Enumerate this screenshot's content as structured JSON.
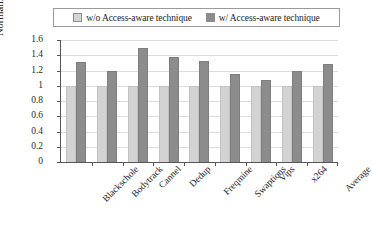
{
  "chart_data": {
    "type": "bar",
    "title": "",
    "xlabel": "",
    "ylabel": "Normalized lifetime",
    "ylim": [
      0,
      1.6
    ],
    "ytick_values": [
      0,
      0.2,
      0.4,
      0.6,
      0.8,
      1,
      1.2,
      1.4,
      1.6
    ],
    "ytick_labels": [
      "0",
      "0.2",
      "0.4",
      "0.6",
      "0.8",
      "1",
      "1.2",
      "1.4",
      "1.6"
    ],
    "grid": true,
    "legend_position": "top-center",
    "categories": [
      "Blackschole",
      "Bodytrack",
      "Cannel",
      "Dedup",
      "Freqmine",
      "Swaptions",
      "Vips",
      "x264",
      "Average"
    ],
    "series": [
      {
        "name": "w/o Access-aware technique",
        "color": "#d3d3d3",
        "values": [
          1.0,
          1.0,
          1.0,
          1.0,
          1.0,
          1.0,
          1.0,
          1.0,
          1.0
        ]
      },
      {
        "name": "w/ Access-aware technique",
        "color": "#8c8c8c",
        "values": [
          1.31,
          1.2,
          1.5,
          1.38,
          1.33,
          1.15,
          1.08,
          1.2,
          1.28
        ]
      }
    ]
  },
  "legend": {
    "entries": [
      {
        "label": "w/o Access-aware technique",
        "swatch": "legend-swatch-light"
      },
      {
        "label": "w/ Access-aware technique",
        "swatch": "legend-swatch-dark"
      }
    ]
  },
  "axes": {
    "y_title": "Normalized lifetime"
  }
}
